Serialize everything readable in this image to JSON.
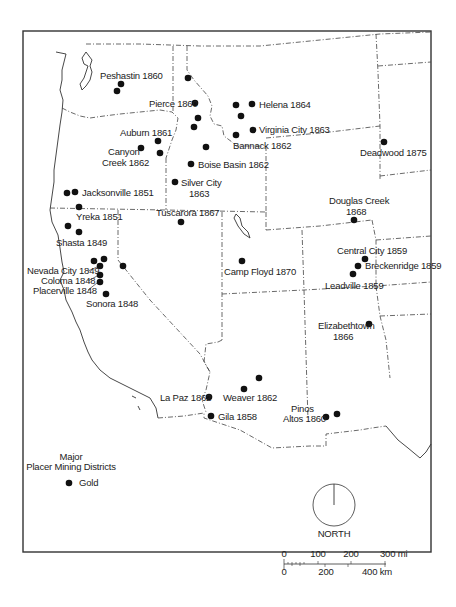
{
  "map": {
    "title": "Major Placer Mining Districts",
    "legend": {
      "title_line1": "Major",
      "title_line2": "Placer Mining Districts",
      "items": [
        {
          "symbol": "filled-circle",
          "label": "Gold"
        }
      ]
    },
    "north_arrow": {
      "label": "NORTH"
    },
    "scale_bar": {
      "miles": {
        "ticks": [
          "0",
          "100",
          "200",
          "300 mi"
        ]
      },
      "km": {
        "ticks": [
          "0",
          "200",
          "400 km"
        ]
      }
    },
    "districts": [
      {
        "name": "Peshastin 1860",
        "lines": [
          "Peshastin 1860"
        ]
      },
      {
        "name": "Pierce 1860",
        "lines": [
          "Pierce 1860"
        ]
      },
      {
        "name": "Helena 1864",
        "lines": [
          "Helena 1864"
        ]
      },
      {
        "name": "Virginia City 1863",
        "lines": [
          "Virginia City 1863"
        ]
      },
      {
        "name": "Bannack 1862",
        "lines": [
          "Bannack 1862"
        ]
      },
      {
        "name": "Auburn 1861",
        "lines": [
          "Auburn 1861"
        ]
      },
      {
        "name": "Canyon Creek 1862",
        "lines": [
          "Canyon",
          "Creek 1862"
        ]
      },
      {
        "name": "Boise Basin 1862",
        "lines": [
          "Boise Basin 1862"
        ]
      },
      {
        "name": "Silver City 1863",
        "lines": [
          "Silver City",
          "1863"
        ]
      },
      {
        "name": "Deadwood 1875",
        "lines": [
          "Deadwood 1875"
        ]
      },
      {
        "name": "Jacksonville 1851",
        "lines": [
          "Jacksonville 1851"
        ]
      },
      {
        "name": "Yreka 1851",
        "lines": [
          "Yreka 1851"
        ]
      },
      {
        "name": "Shasta 1849",
        "lines": [
          "Shasta 1849"
        ]
      },
      {
        "name": "Tuscarora 1867",
        "lines": [
          "Tuscarora 1867"
        ]
      },
      {
        "name": "Douglas Creek 1868",
        "lines": [
          "Douglas Creek",
          "1868"
        ]
      },
      {
        "name": "Nevada City 1849",
        "lines": [
          "Nevada City 1849"
        ]
      },
      {
        "name": "Coloma 1848",
        "lines": [
          "Coloma 1848"
        ]
      },
      {
        "name": "Placerville 1848",
        "lines": [
          "Placerville 1848"
        ]
      },
      {
        "name": "Sonora 1848",
        "lines": [
          "Sonora 1848"
        ]
      },
      {
        "name": "Camp Floyd 1870",
        "lines": [
          "Camp Floyd 1870"
        ]
      },
      {
        "name": "Central City 1859",
        "lines": [
          "Central City 1859"
        ]
      },
      {
        "name": "Breckenridge 1859",
        "lines": [
          "Breckenridge 1859"
        ]
      },
      {
        "name": "Leadville 1859",
        "lines": [
          "Leadville 1859"
        ]
      },
      {
        "name": "Elizabethtown 1866",
        "lines": [
          "Elizabethtown",
          "1866"
        ]
      },
      {
        "name": "La Paz 1862",
        "lines": [
          "La Paz 1862"
        ]
      },
      {
        "name": "Weaver 1862",
        "lines": [
          "Weaver 1862"
        ]
      },
      {
        "name": "Gila 1858",
        "lines": [
          "Gila 1858"
        ]
      },
      {
        "name": "Pinos Altos 1860",
        "lines": [
          "Pinos",
          "Altos 1860"
        ]
      }
    ]
  }
}
